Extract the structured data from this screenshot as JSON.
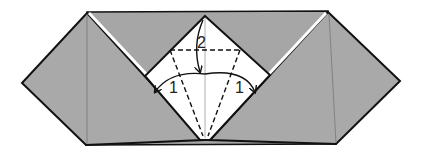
{
  "diagram": {
    "type": "origami-fold-step",
    "colors": {
      "paper_gray": "#a9a9a9",
      "paper_white": "#ffffff",
      "outline": "#111111",
      "crease": "#888888"
    },
    "step_labels": [
      {
        "id": "fold-1-left",
        "text": "1"
      },
      {
        "id": "fold-1-right",
        "text": "1"
      },
      {
        "id": "fold-2-top",
        "text": "2"
      }
    ],
    "arrows": [
      {
        "id": "arrow-1-left",
        "meaning": "fold left flap to center"
      },
      {
        "id": "arrow-1-right",
        "meaning": "fold right flap to center"
      },
      {
        "id": "arrow-2-top",
        "meaning": "fold top point down"
      }
    ],
    "lines": {
      "valley_folds": [
        "horizontal-top",
        "diagonal-left",
        "diagonal-right"
      ],
      "center_crease": "vertical"
    }
  }
}
